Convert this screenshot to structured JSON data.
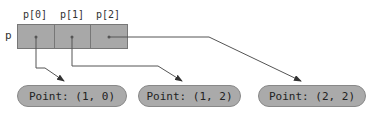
{
  "diagram": {
    "variable": "p",
    "indices": [
      "p[0]",
      "p[1]",
      "p[2]"
    ],
    "objects": [
      "Point: (1, 0)",
      "Point: (1, 2)",
      "Point: (2, 2)"
    ],
    "colors": {
      "cell_fill": "#a8a8a8",
      "pill_fill": "#aaaaaa",
      "line": "#555555"
    }
  }
}
